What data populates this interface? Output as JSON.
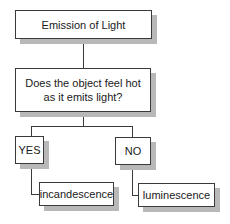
{
  "diagram": {
    "type": "flowchart",
    "title": "Emission of Light",
    "question": "Does the object feel hot as it emits light?",
    "branches": [
      {
        "label": "YES",
        "result": "incandescence"
      },
      {
        "label": "NO",
        "result": "luminescence"
      }
    ]
  }
}
